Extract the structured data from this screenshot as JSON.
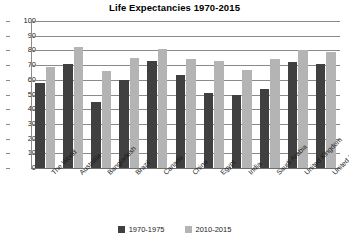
{
  "chart_data": {
    "type": "bar",
    "title": "Life Expectancies 1970-2015",
    "xlabel": "",
    "ylabel": "",
    "ylim": [
      0,
      100
    ],
    "ytick_step": 10,
    "yticks": [
      100,
      90,
      80,
      70,
      60,
      50,
      40,
      30,
      20,
      10,
      0
    ],
    "grid": true,
    "legend_position": "bottom-center",
    "categories": [
      "The World",
      "Australia",
      "Bangladesh",
      "Brazil",
      "Canada",
      "China",
      "Egypt",
      "India",
      "Saudi Arabia",
      "United Kingdom",
      "United States"
    ],
    "series": [
      {
        "name": "1970-1975",
        "color": "#404040",
        "values": [
          58,
          71,
          45,
          60,
          73,
          63,
          51,
          50,
          54,
          72,
          71
        ]
      },
      {
        "name": "2010-2015",
        "color": "#b4b4b4",
        "values": [
          69,
          82,
          66,
          75,
          81,
          74,
          73,
          67,
          74,
          80,
          79
        ]
      }
    ]
  },
  "legend": {
    "items": [
      {
        "label": "1970-1975",
        "color": "#404040"
      },
      {
        "label": "2010-2015",
        "color": "#b4b4b4"
      }
    ]
  }
}
